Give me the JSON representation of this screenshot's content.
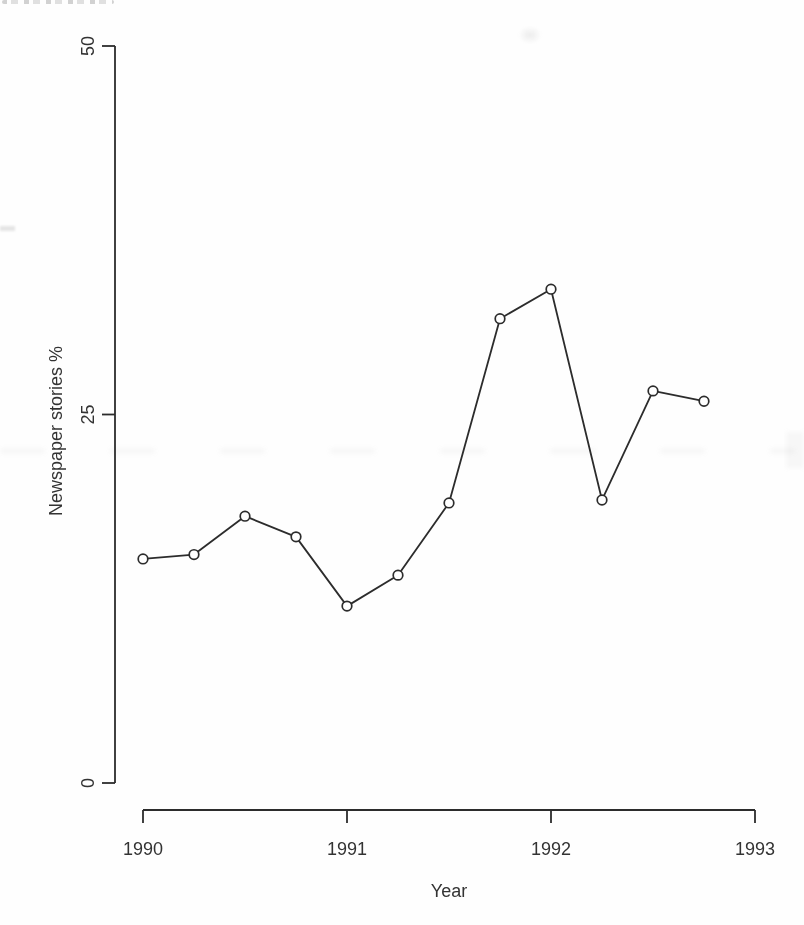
{
  "chart_data": {
    "type": "line",
    "title": "",
    "xlabel": "Year",
    "ylabel": "Newspaper stories %",
    "x": [
      1990.0,
      1990.25,
      1990.5,
      1990.75,
      1991.0,
      1991.25,
      1991.5,
      1991.75,
      1992.0,
      1992.25,
      1992.5,
      1992.75
    ],
    "values": [
      15.2,
      15.5,
      18.1,
      16.7,
      12.0,
      14.1,
      19.0,
      31.5,
      33.5,
      19.2,
      26.6,
      25.9
    ],
    "xlim": [
      1990,
      1993
    ],
    "ylim": [
      0,
      50
    ],
    "xticks": [
      1990,
      1991,
      1992,
      1993
    ],
    "yticks": [
      0,
      25,
      50
    ],
    "grid": false,
    "legend": null,
    "marker": "open-circle",
    "line_color": "#2c2c2c",
    "axis_color": "#2c2c2c",
    "text_color": "#333333",
    "background_color": "#fefefe"
  }
}
